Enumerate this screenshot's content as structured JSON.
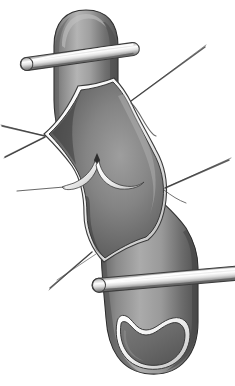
{
  "figure": {
    "title": "Open arteriotomy of vessel with retraction sutures and vascular clamps",
    "caption": "",
    "canvas": {
      "width": 235,
      "height": 386
    },
    "background_color": "#ffffff",
    "style": "grayscale airbrush medical illustration",
    "palette": {
      "background": "#ffffff",
      "outline": "#2b2b2b",
      "vessel_wall_light": "#b9b9b9",
      "vessel_wall_mid": "#8e8e8e",
      "vessel_wall_dark": "#5d5d5d",
      "vessel_wall_deep_shadow": "#3c3c3c",
      "lumen_dark": "#4a4a4a",
      "lumen_mid": "#6f6f6f",
      "lumen_light": "#9a9a9a",
      "intima_edge_highlight": "#f2f2f2",
      "intima_edge_shadow": "#707070",
      "clamp_metal_light": "#ffffff",
      "clamp_metal_mid": "#c9c9c9",
      "clamp_metal_dark": "#6a6a6a",
      "suture_thread": "#4d4d4d"
    }
  },
  "parts": {
    "vessel_upper": {
      "label": "Upper vessel segment with rounded dome end",
      "description": "Tubular artery running vertically, domed superior end, airbrushed cylindrical shading"
    },
    "vessel_lower": {
      "label": "Lower vessel segment with transected end",
      "description": "Tubular artery continuing inferiorly, cut open at the bottom exposing kidney-bean lumen"
    },
    "arteriotomy": {
      "label": "Longitudinal arteriotomy opening",
      "description": "Elongated diamond/leaf shaped opening in the vessel wall, edges everted with pale intimal rim"
    },
    "intimal_notch": {
      "label": "Central intimal notch / plaque endpoint",
      "description": "Small V-shaped cusp at mid-lumen with two scalloped shelves flanking it"
    },
    "clamp_upper": {
      "label": "Upper vascular clamp",
      "description": "Metallic bar crossing the upper vessel obliquely, rounded left tip, bright specular highlight"
    },
    "clamp_lower": {
      "label": "Lower vascular clamp",
      "description": "Metallic bar crossing the lower vessel obliquely, rounded left tip, extends off the right edge"
    },
    "lumen_distal": {
      "label": "Distal cut lumen",
      "description": "Kidney-bean shaped open lumen at the inferior transected end, outlined by pale intima"
    }
  },
  "sutures": [
    {
      "id": "suture-upper-right-long",
      "label": "Upper right retraction suture",
      "anchor": "right apex of arteriotomy",
      "direction": "upper-right",
      "length": "long"
    },
    {
      "id": "suture-upper-right-short",
      "label": "Upper right suture tail",
      "anchor": "right apex of arteriotomy",
      "direction": "right",
      "length": "short"
    },
    {
      "id": "suture-mid-right-long",
      "label": "Mid right retraction suture",
      "anchor": "right mid vertex",
      "direction": "upper-right",
      "length": "long"
    },
    {
      "id": "suture-mid-right-tail",
      "label": "Mid right suture tail",
      "anchor": "right mid vertex",
      "direction": "right",
      "length": "short"
    },
    {
      "id": "suture-left-upper",
      "label": "Left upper retraction suture",
      "anchor": "left apex of arteriotomy",
      "direction": "upper-left",
      "length": "long"
    },
    {
      "id": "suture-left-lower",
      "label": "Left lower retraction suture",
      "anchor": "left apex of arteriotomy",
      "direction": "lower-left",
      "length": "medium"
    },
    {
      "id": "suture-left-stub",
      "label": "Left suture stub",
      "anchor": "left wall mid",
      "direction": "left",
      "length": "short"
    },
    {
      "id": "suture-bottom-left",
      "label": "Inferior left retraction suture",
      "anchor": "inferior vertex of arteriotomy",
      "direction": "lower-left",
      "length": "long"
    }
  ],
  "annotations": {
    "labels": [],
    "leader_lines": []
  }
}
